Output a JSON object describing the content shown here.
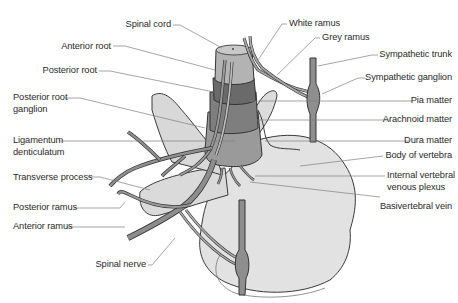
{
  "diagram": {
    "type": "anatomical illustration",
    "colors": {
      "bone": "#e0e0e0",
      "bone_outline": "#3a3a3a",
      "nerve": "#8f8f8f",
      "cord": "#a8a8a8",
      "pia": "#6d6d6d",
      "arachnoid": "#7c7c7c",
      "dura": "#959595",
      "leader_line": "#7a7a7a",
      "text": "#2a2a2a"
    }
  },
  "labels_left": [
    {
      "id": "spinal-cord",
      "text": "Spinal cord"
    },
    {
      "id": "anterior-root",
      "text": "Anterior root"
    },
    {
      "id": "posterior-root",
      "text": "Posterior root"
    },
    {
      "id": "posterior-root-ganglion-1",
      "text": "Posterior root"
    },
    {
      "id": "posterior-root-ganglion-2",
      "text": "ganglion"
    },
    {
      "id": "ligamentum-denticulatum-1",
      "text": "Ligamentum"
    },
    {
      "id": "ligamentum-denticulatum-2",
      "text": "denticulatum"
    },
    {
      "id": "transverse-process",
      "text": "Transverse process"
    },
    {
      "id": "posterior-ramus",
      "text": "Posterior ramus"
    },
    {
      "id": "anterior-ramus",
      "text": "Anterior ramus"
    },
    {
      "id": "spinal-nerve",
      "text": "Spinal nerve"
    }
  ],
  "labels_right": [
    {
      "id": "white-ramus",
      "text": "White ramus"
    },
    {
      "id": "grey-ramus",
      "text": "Grey ramus"
    },
    {
      "id": "sympathetic-trunk",
      "text": "Sympathetic trunk"
    },
    {
      "id": "sympathetic-ganglion",
      "text": "Sympathetic ganglion"
    },
    {
      "id": "pia-matter",
      "text": "Pia matter"
    },
    {
      "id": "arachnoid-matter",
      "text": "Arachnoid matter"
    },
    {
      "id": "dura-matter",
      "text": "Dura matter"
    },
    {
      "id": "body-of-vertebra",
      "text": "Body of vertebra"
    },
    {
      "id": "internal-vertebral-venous-plexus-1",
      "text": "Internal vertebral"
    },
    {
      "id": "internal-vertebral-venous-plexus-2",
      "text": "venous plexus"
    },
    {
      "id": "basivertebral-vein",
      "text": "Basivertebral vein"
    }
  ]
}
